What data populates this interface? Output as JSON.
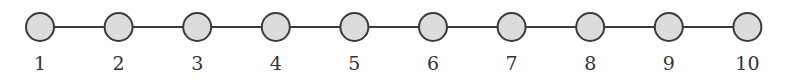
{
  "diagram": {
    "type": "path-graph",
    "nodes": [
      {
        "id": 1,
        "label": "1"
      },
      {
        "id": 2,
        "label": "2"
      },
      {
        "id": 3,
        "label": "3"
      },
      {
        "id": 4,
        "label": "4"
      },
      {
        "id": 5,
        "label": "5"
      },
      {
        "id": 6,
        "label": "6"
      },
      {
        "id": 7,
        "label": "7"
      },
      {
        "id": 8,
        "label": "8"
      },
      {
        "id": 9,
        "label": "9"
      },
      {
        "id": 10,
        "label": "10"
      }
    ],
    "edges": [
      [
        1,
        2
      ],
      [
        2,
        3
      ],
      [
        3,
        4
      ],
      [
        4,
        5
      ],
      [
        5,
        6
      ],
      [
        6,
        7
      ],
      [
        7,
        8
      ],
      [
        8,
        9
      ],
      [
        9,
        10
      ]
    ],
    "colors": {
      "node_fill": "#dcdcdc",
      "stroke": "#3a3a3a",
      "label": "#333333"
    }
  }
}
